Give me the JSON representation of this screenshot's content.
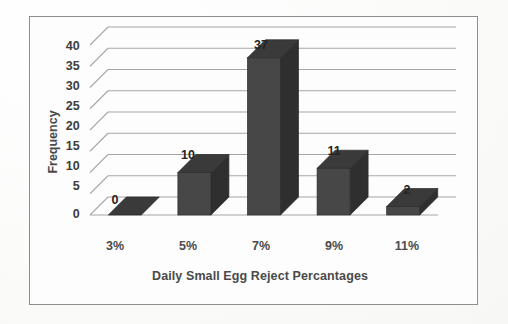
{
  "chart_data": {
    "type": "bar",
    "title": "",
    "subtitle": "",
    "xlabel": "Daily Small Egg Reject Percantages",
    "ylabel": "Frequency",
    "categories": [
      "3%",
      "5%",
      "7%",
      "9%",
      "11%"
    ],
    "values": [
      0,
      10,
      37,
      11,
      2
    ],
    "data_labels": [
      "0",
      "10",
      "37",
      "11",
      "2"
    ],
    "yticks": [
      0,
      5,
      10,
      15,
      20,
      25,
      30,
      35,
      40
    ],
    "ytick_labels": [
      "0",
      "5",
      "10",
      "15",
      "20",
      "25",
      "30",
      "35",
      "40"
    ],
    "ylim": [
      0,
      40
    ],
    "grid": true,
    "grid_axis": "y",
    "legend": false,
    "legend_position": "none",
    "style": "3d-column",
    "series": [
      {
        "name": "Frequency",
        "values": [
          0,
          10,
          37,
          11,
          2
        ]
      }
    ],
    "colors": {
      "bar_front": "#474747",
      "bar_top": "#3a3a3a",
      "bar_side": "#2f2f2f",
      "gridline": "#a6a6a6",
      "axis_text": "#4a4a4a",
      "label_text": "#242424",
      "border": "#8d8d8d",
      "background": "#fdfdfd"
    }
  }
}
